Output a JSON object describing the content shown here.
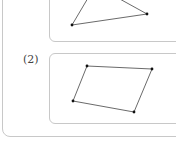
{
  "problem": {
    "items": [
      {
        "label": "",
        "shape": "triangle",
        "vertices": [
          [
            72,
            25
          ],
          [
            147,
            14
          ]
        ],
        "partial_edges": [
          [
            [
              72,
              25
            ],
            [
              88,
              0
            ]
          ],
          [
            [
              147,
              14
            ],
            [
              120,
              0
            ]
          ]
        ]
      },
      {
        "label": "(2)",
        "shape": "quadrilateral",
        "vertices": [
          [
            87,
            66
          ],
          [
            152,
            69
          ],
          [
            134,
            112
          ],
          [
            73,
            101
          ]
        ]
      }
    ]
  },
  "colors": {
    "border": "#c8c8c8",
    "line": "#444444",
    "vertex": "#111111"
  }
}
